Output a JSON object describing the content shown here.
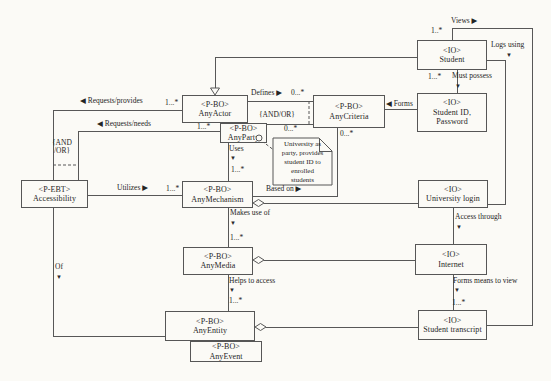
{
  "palette": {
    "line": "#575757",
    "text": "#1f1f1f",
    "paper": "#fbfaf6"
  },
  "diagram": {
    "nodes": [
      {
        "id": "accessibility",
        "kind": "class",
        "x": 21,
        "y": 180,
        "w": 67,
        "h": 28,
        "lines": [
          "<P-EBT>",
          "Accessibility"
        ]
      },
      {
        "id": "any-actor",
        "kind": "class",
        "x": 182,
        "y": 95,
        "w": 66,
        "h": 28,
        "lines": [
          "<P-BO>",
          "AnyActor"
        ]
      },
      {
        "id": "any-party",
        "kind": "class",
        "x": 220,
        "y": 123,
        "w": 47,
        "h": 20,
        "lines": [
          "<P-BO>",
          "AnyParty"
        ]
      },
      {
        "id": "any-criteria",
        "kind": "class",
        "x": 313,
        "y": 95,
        "w": 72,
        "h": 33,
        "lines": [
          "<P-BO>",
          "AnyCriteria"
        ]
      },
      {
        "id": "any-mechanism",
        "kind": "class",
        "x": 182,
        "y": 181,
        "w": 71,
        "h": 27,
        "lines": [
          "<P-BO>",
          "AnyMechanism"
        ]
      },
      {
        "id": "any-media",
        "kind": "class",
        "x": 183,
        "y": 247,
        "w": 70,
        "h": 28,
        "lines": [
          "<P-BO>",
          "AnyMedia"
        ]
      },
      {
        "id": "any-entity",
        "kind": "class",
        "x": 165,
        "y": 311,
        "w": 90,
        "h": 30,
        "lines": [
          "<P-BO>",
          "AnyEntity"
        ]
      },
      {
        "id": "any-event",
        "kind": "class",
        "x": 190,
        "y": 341,
        "w": 72,
        "h": 21,
        "lines": [
          "<P-BO>",
          "AnyEvent"
        ]
      },
      {
        "id": "student",
        "kind": "class",
        "x": 417,
        "y": 40,
        "w": 70,
        "h": 30,
        "lines": [
          "<IO>",
          "Student"
        ]
      },
      {
        "id": "student-id-password",
        "kind": "class",
        "x": 417,
        "y": 93,
        "w": 70,
        "h": 39,
        "lines": [
          "<IO>",
          "Student ID,",
          "Password"
        ]
      },
      {
        "id": "university-login",
        "kind": "class",
        "x": 418,
        "y": 180,
        "w": 70,
        "h": 28,
        "lines": [
          "<IO>",
          "University login"
        ]
      },
      {
        "id": "internet",
        "kind": "class",
        "x": 415,
        "y": 244,
        "w": 72,
        "h": 31,
        "lines": [
          "<IO>",
          "Internet"
        ]
      },
      {
        "id": "student-transcript",
        "kind": "class",
        "x": 418,
        "y": 310,
        "w": 69,
        "h": 30,
        "lines": [
          "<IO>",
          "Student transcript"
        ]
      }
    ],
    "note": {
      "id": "university-note",
      "x": 273,
      "y": 138,
      "w": 59,
      "h": 47,
      "fold": 13,
      "lines": [
        "University as",
        "party, provides",
        "student ID to",
        "enrolled",
        "students"
      ]
    },
    "edges": [
      {
        "id": "generalization-student-anyactor",
        "pts": [
          [
            417,
            57
          ],
          [
            215,
            57
          ],
          [
            215,
            88
          ]
        ]
      },
      {
        "id": "views",
        "pts": [
          [
            452,
            40
          ],
          [
            452,
            28
          ],
          [
            532,
            28
          ],
          [
            532,
            325
          ],
          [
            487,
            325
          ]
        ]
      },
      {
        "id": "logs-using",
        "pts": [
          [
            487,
            60
          ],
          [
            505,
            60
          ],
          [
            505,
            204
          ],
          [
            488,
            204
          ]
        ]
      },
      {
        "id": "must-possess",
        "pts": [
          [
            457,
            70
          ],
          [
            457,
            93
          ]
        ]
      },
      {
        "id": "forms",
        "pts": [
          [
            385,
            109
          ],
          [
            417,
            109
          ]
        ]
      },
      {
        "id": "defines",
        "pts": [
          [
            248,
            101
          ],
          [
            313,
            101
          ]
        ]
      },
      {
        "id": "anyparty-anycriteria",
        "pts": [
          [
            257,
            124
          ],
          [
            313,
            124
          ]
        ]
      },
      {
        "id": "requests-provides",
        "pts": [
          [
            182,
            110
          ],
          [
            53,
            110
          ],
          [
            53,
            180
          ]
        ]
      },
      {
        "id": "requests-needs",
        "pts": [
          [
            220,
            131
          ],
          [
            78,
            131
          ],
          [
            78,
            180
          ]
        ]
      },
      {
        "id": "utilizes",
        "pts": [
          [
            88,
            195
          ],
          [
            182,
            195
          ]
        ]
      },
      {
        "id": "uses",
        "pts": [
          [
            228,
            143
          ],
          [
            228,
            181
          ]
        ]
      },
      {
        "id": "based-on",
        "pts": [
          [
            253,
            196
          ],
          [
            337,
            196
          ],
          [
            337,
            128
          ]
        ]
      },
      {
        "id": "mechanism-login",
        "pts": [
          [
            264,
            203
          ],
          [
            418,
            203
          ]
        ]
      },
      {
        "id": "access-through",
        "pts": [
          [
            453,
            208
          ],
          [
            453,
            244
          ]
        ]
      },
      {
        "id": "media-internet",
        "pts": [
          [
            264,
            260
          ],
          [
            415,
            260
          ]
        ]
      },
      {
        "id": "makes-use-of",
        "pts": [
          [
            228,
            208
          ],
          [
            228,
            247
          ]
        ]
      },
      {
        "id": "helps-to-access",
        "pts": [
          [
            228,
            275
          ],
          [
            228,
            311
          ]
        ]
      },
      {
        "id": "entity-transcript",
        "pts": [
          [
            266,
            327
          ],
          [
            418,
            327
          ]
        ]
      },
      {
        "id": "forms-means-to-view",
        "pts": [
          [
            453,
            275
          ],
          [
            453,
            310
          ]
        ]
      },
      {
        "id": "of",
        "pts": [
          [
            53,
            208
          ],
          [
            53,
            336
          ],
          [
            165,
            336
          ]
        ]
      },
      {
        "id": "and-or-constraint-right",
        "dashed": true,
        "pts": [
          [
            309,
            101
          ],
          [
            309,
            124
          ]
        ]
      },
      {
        "id": "and-or-constraint-left",
        "dashed": true,
        "pts": [
          [
            53,
            165
          ],
          [
            78,
            165
          ]
        ]
      },
      {
        "id": "note-anchor-line",
        "dashed": true,
        "pts": [
          [
            262,
            141
          ],
          [
            275,
            151
          ]
        ]
      }
    ],
    "shapes": [
      {
        "id": "generalization-arrow",
        "type": "triangle",
        "points": "215,95 210.5,88 219.5,88"
      },
      {
        "id": "aggregation-mechanism",
        "type": "diamond",
        "cx": 258.5,
        "cy": 203
      },
      {
        "id": "aggregation-media",
        "type": "diamond",
        "cx": 258.5,
        "cy": 260
      },
      {
        "id": "aggregation-entity",
        "type": "diamond",
        "cx": 260.5,
        "cy": 327
      },
      {
        "id": "note-anchor-circle",
        "type": "circle",
        "cx": 259,
        "cy": 138,
        "r": 3
      }
    ],
    "labels": [
      {
        "id": "views",
        "text": "Views ▶",
        "x": 451,
        "y": 17
      },
      {
        "id": "views-mult",
        "text": "1..*",
        "x": 431,
        "y": 27
      },
      {
        "id": "logs-using",
        "text": "Logs using",
        "x": 491,
        "y": 41
      },
      {
        "id": "logs-using-arrow",
        "text": "▼",
        "x": 506,
        "y": 51,
        "cls": "arr"
      },
      {
        "id": "must-possess",
        "text": "Must possess",
        "x": 452,
        "y": 72
      },
      {
        "id": "must-possess-arrow",
        "text": "▼",
        "x": 455,
        "y": 82,
        "cls": "arr"
      },
      {
        "id": "must-possess-mult",
        "text": "1...*",
        "x": 428,
        "y": 73
      },
      {
        "id": "forms",
        "text": "◀ Forms",
        "x": 386,
        "y": 100
      },
      {
        "id": "defines",
        "text": "Defines ▶",
        "x": 251,
        "y": 89
      },
      {
        "id": "defines-mult",
        "text": "0...*",
        "x": 291,
        "y": 89
      },
      {
        "id": "and-or-right",
        "text": "{AND/OR}",
        "x": 259,
        "y": 111
      },
      {
        "id": "party-criteria-mult",
        "text": "0...*",
        "x": 284,
        "y": 125
      },
      {
        "id": "based-on-mult",
        "text": "0...*",
        "x": 340,
        "y": 130
      },
      {
        "id": "requests-provides",
        "text": "◀ Requests/provides",
        "x": 80,
        "y": 97
      },
      {
        "id": "requests-provides-mult",
        "text": "1...*",
        "x": 165,
        "y": 99
      },
      {
        "id": "requests-needs",
        "text": "◀ Requests/needs",
        "x": 97,
        "y": 120
      },
      {
        "id": "requests-needs-mult",
        "text": "1...*",
        "x": 197,
        "y": 123
      },
      {
        "id": "and-or-left-1",
        "text": "{AND",
        "x": 52,
        "y": 139
      },
      {
        "id": "and-or-left-2",
        "text": "/OR}",
        "x": 54,
        "y": 147
      },
      {
        "id": "utilizes",
        "text": "Utilizes ▶",
        "x": 117,
        "y": 184
      },
      {
        "id": "utilizes-mult",
        "text": "1...*",
        "x": 166,
        "y": 185
      },
      {
        "id": "uses",
        "text": "Uses",
        "x": 229,
        "y": 145
      },
      {
        "id": "uses-arrow",
        "text": "▼",
        "x": 230,
        "y": 154,
        "cls": "arr"
      },
      {
        "id": "uses-mult",
        "text": "1...*",
        "x": 231,
        "y": 166
      },
      {
        "id": "based-on",
        "text": "Based on ▶",
        "x": 266,
        "y": 185
      },
      {
        "id": "makes-use-of",
        "text": "Makes use of",
        "x": 230,
        "y": 209
      },
      {
        "id": "makes-use-of-arrow",
        "text": "▼",
        "x": 230,
        "y": 219,
        "cls": "arr"
      },
      {
        "id": "makes-use-of-mult",
        "text": "1...*",
        "x": 230,
        "y": 234
      },
      {
        "id": "helps-to-access",
        "text": "Helps to access",
        "x": 229,
        "y": 277
      },
      {
        "id": "helps-to-access-arrow",
        "text": "▼",
        "x": 229,
        "y": 286,
        "cls": "arr"
      },
      {
        "id": "helps-to-access-mult",
        "text": "1...*",
        "x": 229,
        "y": 297
      },
      {
        "id": "access-through",
        "text": "Access through",
        "x": 455,
        "y": 213
      },
      {
        "id": "access-through-arrow",
        "text": "▼",
        "x": 456,
        "y": 223,
        "cls": "arr"
      },
      {
        "id": "forms-means",
        "text": "Forms means to view",
        "x": 453,
        "y": 277
      },
      {
        "id": "forms-means-arrow",
        "text": "▼",
        "x": 454,
        "y": 286,
        "cls": "arr"
      },
      {
        "id": "forms-means-mult",
        "text": "1...*",
        "x": 452,
        "y": 299
      },
      {
        "id": "of",
        "text": "Of",
        "x": 55,
        "y": 263
      },
      {
        "id": "of-arrow",
        "text": "▼",
        "x": 56,
        "y": 273,
        "cls": "arr"
      }
    ]
  }
}
